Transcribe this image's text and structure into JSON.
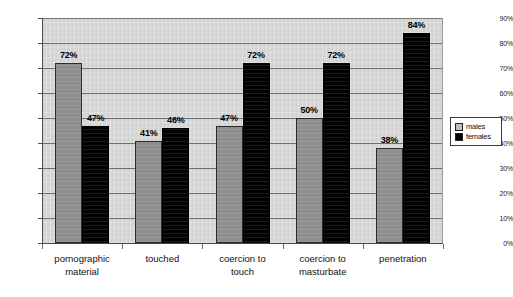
{
  "chart_data": {
    "type": "bar",
    "title": "",
    "subtitle": "",
    "xlabel": "",
    "ylabel": "",
    "ylim": [
      0,
      90
    ],
    "ytick_labels": [
      "0%",
      "10%",
      "20%",
      "30%",
      "40%",
      "50%",
      "60%",
      "70%",
      "80%",
      "90%"
    ],
    "ytick_values": [
      0,
      10,
      20,
      30,
      40,
      50,
      60,
      70,
      80,
      90
    ],
    "grid": true,
    "legend_position": "right",
    "categories": [
      "pornographic\nmaterial",
      "touched",
      "coercion to\ntouch",
      "coercion to\nmasturbate",
      "penetration"
    ],
    "series": [
      {
        "name": "males",
        "color": "#8e8e8e",
        "values": [
          72,
          41,
          47,
          50,
          38
        ],
        "labels": [
          "72%",
          "41%",
          "47%",
          "50%",
          "38%"
        ]
      },
      {
        "name": "females",
        "color": "#000000",
        "values": [
          47,
          46,
          72,
          72,
          84
        ],
        "labels": [
          "47%",
          "46%",
          "72%",
          "72%",
          "84%"
        ]
      }
    ]
  },
  "legend": {
    "items": [
      {
        "label": "males",
        "swatch": "males"
      },
      {
        "label": "females",
        "swatch": "females"
      }
    ]
  },
  "colors": {
    "plot_background": "#d3d3d3",
    "gridline": "#6e6e6e",
    "axis": "#4a4a4a",
    "males": "#8e8e8e",
    "females": "#000000",
    "page_background": "#ffffff"
  }
}
